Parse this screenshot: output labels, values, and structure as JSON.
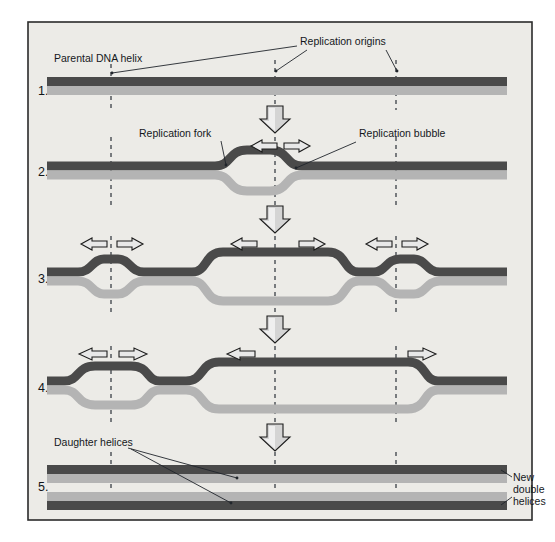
{
  "figure": {
    "frame": {
      "background_color": "#eceae6",
      "border_color": "#2b2b2b",
      "outer_background": "#ffffff"
    },
    "colors": {
      "parental_strand": "#4a4a4a",
      "new_strand": "#b4b4b4",
      "strand_dark": "#454545",
      "strand_light": "#bdbdbd",
      "arrow_fill": "#e8e8e8",
      "arrow_stroke": "#1c1c1c",
      "dashed_line": "#3a3f45",
      "text": "#14181c"
    },
    "steps": [
      {
        "number": "1.",
        "name": "parental-helix-intact"
      },
      {
        "number": "2.",
        "name": "single-replication-bubble"
      },
      {
        "number": "3.",
        "name": "three-replication-bubbles"
      },
      {
        "number": "4.",
        "name": "bubbles-expanding"
      },
      {
        "number": "5.",
        "name": "two-daughter-helices"
      }
    ],
    "labels": {
      "parental_dna_helix": "Parental DNA helix",
      "replication_origins": "Replication origins",
      "replication_fork": "Replication fork",
      "replication_bubble": "Replication bubble",
      "daughter_helices": "Daughter helices",
      "new_double_helices_line1": "New",
      "new_double_helices_line2": "double",
      "new_double_helices_line3": "helices"
    },
    "origins": {
      "count": 3,
      "x_positions": [
        111,
        275,
        396
      ]
    },
    "arrows": {
      "down_arrow_count": 4,
      "fork_arrow_rows": [
        {
          "step": "2",
          "pairs": 1
        },
        {
          "step": "3",
          "pairs": 3
        },
        {
          "step": "4",
          "pairs": 3
        }
      ]
    }
  }
}
